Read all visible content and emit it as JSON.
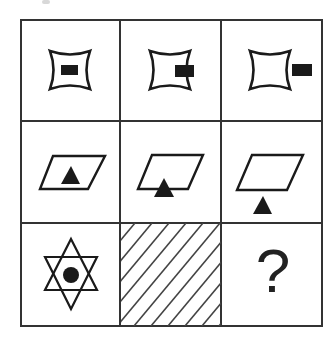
{
  "puzzle": {
    "type": "3x3 figure reasoning matrix",
    "grid": {
      "rows": 3,
      "cols": 3,
      "border_color": "#333333"
    },
    "cells": [
      {
        "row": 1,
        "col": 1,
        "shape": "concave-square",
        "marker": "filled-rectangle",
        "marker_position": "inside"
      },
      {
        "row": 1,
        "col": 2,
        "shape": "concave-square",
        "marker": "filled-rectangle",
        "marker_position": "straddling-right-edge"
      },
      {
        "row": 1,
        "col": 3,
        "shape": "concave-square",
        "marker": "filled-rectangle",
        "marker_position": "outside-right"
      },
      {
        "row": 2,
        "col": 1,
        "shape": "parallelogram",
        "marker": "filled-triangle",
        "marker_position": "inside"
      },
      {
        "row": 2,
        "col": 2,
        "shape": "parallelogram",
        "marker": "filled-triangle",
        "marker_position": "straddling-bottom-edge"
      },
      {
        "row": 2,
        "col": 3,
        "shape": "parallelogram",
        "marker": "filled-triangle",
        "marker_position": "outside-below"
      },
      {
        "row": 3,
        "col": 1,
        "shape": "hexagram",
        "marker": "filled-circle",
        "marker_position": "inside"
      },
      {
        "row": 3,
        "col": 2,
        "shape": "diagonal-hatching",
        "marker": "none",
        "marker_position": "covered"
      },
      {
        "row": 3,
        "col": 3,
        "shape": "question-mark",
        "marker": "none",
        "marker_position": "unknown"
      }
    ],
    "question_label": "?"
  },
  "colors": {
    "stroke": "#1a1a1a",
    "fill": "#1a1a1a",
    "grid": "#333333",
    "hatch": "#444444",
    "background": "#ffffff"
  }
}
